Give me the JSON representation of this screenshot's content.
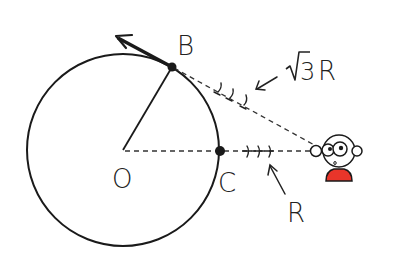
{
  "diagram": {
    "labels": {
      "center": "O",
      "point_b": "B",
      "point_c": "C",
      "sqrt_symbol": "√",
      "sqrt_value": "3",
      "distance_b": "R",
      "distance_c": "R"
    },
    "colors": {
      "ink": "#1a1a1a",
      "shirt": "#e8352a",
      "background": "#ffffff"
    },
    "geometry": {
      "circle_center": [
        123,
        150
      ],
      "circle_radius": 96,
      "point_b": [
        172,
        67
      ],
      "point_c": [
        220,
        151
      ],
      "observer": [
        335,
        150
      ]
    }
  }
}
